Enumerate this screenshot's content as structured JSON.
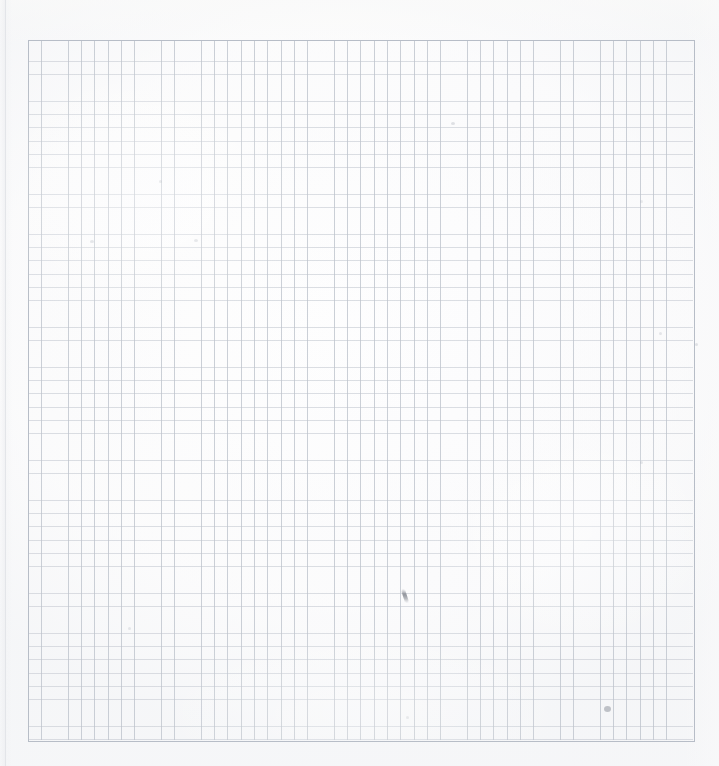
{
  "document": {
    "kind": "scanned-graph-paper",
    "title": "Blank graph paper sheet (scan)",
    "page_width": 719,
    "page_height": 766,
    "background_color": "#fdfdfd",
    "has_text": false,
    "visible_text": ""
  },
  "grid": {
    "label": "ruled square grid",
    "left": 28,
    "top": 40,
    "width": 665,
    "height": 700,
    "cell_size": 13.3,
    "columns": 50,
    "rows": 53,
    "line_color": "#bac0c9",
    "horizontal_line_color": "#c4c9d1",
    "border_color": "#b4bac4",
    "major_lines": false,
    "axis_labels": [],
    "tick_labels": []
  },
  "artifacts": {
    "page_edge_shadow": {
      "label": "left page edge scan shadow",
      "x": 5,
      "color": "#e2e4e8"
    },
    "marks": [
      {
        "name": "speck-upper-mid",
        "x": 451,
        "y": 122,
        "w": 4,
        "h": 3,
        "opacity": 0.3,
        "color": "#9aa0ab"
      },
      {
        "name": "speck-left-upper",
        "x": 90,
        "y": 240,
        "w": 4,
        "h": 3,
        "opacity": 0.26,
        "color": "#a0a6b0"
      },
      {
        "name": "speck-left-upper-2",
        "x": 194,
        "y": 239,
        "w": 4,
        "h": 3,
        "opacity": 0.24,
        "color": "#a0a6b0"
      },
      {
        "name": "speck-top-left",
        "x": 159,
        "y": 180,
        "w": 3,
        "h": 3,
        "opacity": 0.22,
        "color": "#a4aab4"
      },
      {
        "name": "speck-right-upper",
        "x": 640,
        "y": 200,
        "w": 3,
        "h": 3,
        "opacity": 0.22,
        "color": "#a4aab4"
      },
      {
        "name": "speck-right-mid",
        "x": 659,
        "y": 332,
        "w": 3,
        "h": 3,
        "opacity": 0.26,
        "color": "#a0a6b0"
      },
      {
        "name": "speck-right-edge",
        "x": 695,
        "y": 343,
        "w": 3,
        "h": 3,
        "opacity": 0.28,
        "color": "#9aa0ab"
      },
      {
        "name": "speck-right-lower",
        "x": 640,
        "y": 461,
        "w": 3,
        "h": 3,
        "opacity": 0.24,
        "color": "#a0a6b0"
      },
      {
        "name": "speck-left-lower",
        "x": 128,
        "y": 627,
        "w": 3,
        "h": 3,
        "opacity": 0.24,
        "color": "#a0a6b0"
      },
      {
        "name": "speck-mid-lower",
        "x": 406,
        "y": 716,
        "w": 3,
        "h": 3,
        "opacity": 0.2,
        "color": "#a4aab4"
      },
      {
        "name": "smudge-bottom-right",
        "x": 604,
        "y": 706,
        "w": 7,
        "h": 6,
        "opacity": 0.55,
        "color": "#8d929c"
      }
    ],
    "pencil_tick": {
      "name": "pencil-tick-stroke",
      "x": 403,
      "y": 589,
      "w": 4,
      "h": 14,
      "rotation": -18,
      "color": "#6c707a",
      "opacity": 0.85
    }
  }
}
